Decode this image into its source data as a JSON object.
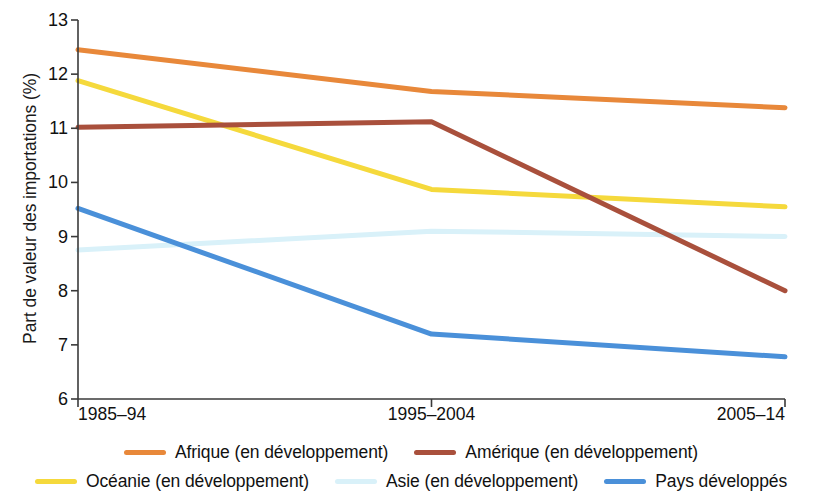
{
  "chart_data": {
    "type": "line",
    "title": "",
    "xlabel": "",
    "ylabel": "Part de valeur des importations (%)",
    "categories": [
      "1985–94",
      "1995–2004",
      "2005–14"
    ],
    "ylim": [
      6,
      13
    ],
    "yticks": [
      6,
      7,
      8,
      9,
      10,
      11,
      12,
      13
    ],
    "ytick_labels": [
      "6",
      "7",
      "8",
      "9",
      "10",
      "11",
      "12",
      "13"
    ],
    "grid": false,
    "legend_position": "bottom",
    "series": [
      {
        "name": "Afrique (en développement)",
        "color": "#E8883A",
        "values": [
          12.45,
          11.68,
          11.38
        ]
      },
      {
        "name": "Amérique (en développement)",
        "color": "#A9503C",
        "values": [
          11.02,
          11.12,
          8.0
        ]
      },
      {
        "name": "Océanie (en développement)",
        "color": "#F5D93C",
        "values": [
          11.88,
          9.87,
          9.55
        ]
      },
      {
        "name": "Asie (en développement)",
        "color": "#D9F1F9",
        "values": [
          8.75,
          9.1,
          9.0
        ]
      },
      {
        "name": "Pays développés",
        "color": "#4A90D9",
        "values": [
          9.52,
          7.2,
          6.78
        ]
      }
    ]
  },
  "axis": {
    "y_title": "Part de valeur des importations (%)",
    "y_tick_labels": [
      "13",
      "12",
      "11",
      "10",
      "9",
      "8",
      "7",
      "6"
    ],
    "x_tick_labels": [
      "1985–94",
      "1995–2004",
      "2005–14"
    ]
  },
  "legend": {
    "row1": [
      {
        "label": "Afrique (en développement)",
        "color": "#E8883A"
      },
      {
        "label": "Amérique (en développement)",
        "color": "#A9503C"
      }
    ],
    "row2": [
      {
        "label": "Océanie (en développement)",
        "color": "#F5D93C"
      },
      {
        "label": "Asie (en développement)",
        "color": "#D9F1F9"
      },
      {
        "label": "Pays développés",
        "color": "#4A90D9"
      }
    ]
  },
  "style": {
    "axis_color": "#3A3A3A",
    "text_color": "#111111",
    "background": "#ffffff"
  }
}
